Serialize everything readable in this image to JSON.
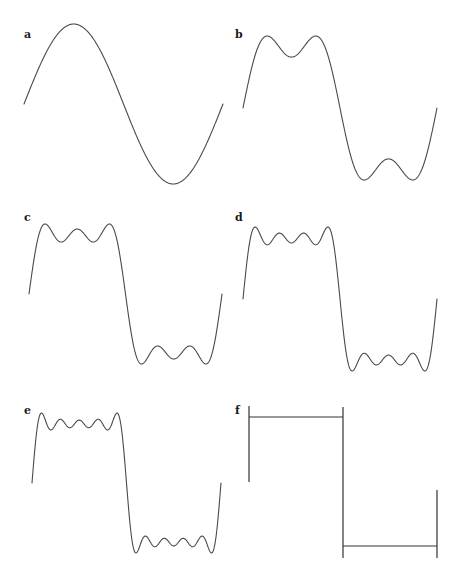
{
  "figure": {
    "panels": [
      {
        "id": "a",
        "label": "a",
        "harmonics": [
          1
        ],
        "x0": 24,
        "x1": 223,
        "ymid": 104,
        "amp": 80,
        "label_x": 24,
        "label_y": 38
      },
      {
        "id": "b",
        "label": "b",
        "harmonics": [
          1,
          3
        ],
        "x0": 243,
        "x1": 437,
        "ymid": 108,
        "amp": 72,
        "label_x": 235,
        "label_y": 38
      },
      {
        "id": "c",
        "label": "c",
        "harmonics": [
          1,
          3,
          5
        ],
        "x0": 29,
        "x1": 222,
        "ymid": 294,
        "amp": 70,
        "label_x": 24,
        "label_y": 221
      },
      {
        "id": "d",
        "label": "d",
        "harmonics": [
          1,
          3,
          5,
          7
        ],
        "x0": 243,
        "x1": 437,
        "ymid": 299,
        "amp": 72,
        "label_x": 235,
        "label_y": 221
      },
      {
        "id": "e",
        "label": "e",
        "harmonics": [
          1,
          3,
          5,
          7,
          9
        ],
        "x0": 32,
        "x1": 221,
        "ymid": 483,
        "amp": 70,
        "label_x": 24,
        "label_y": 414
      },
      {
        "id": "f",
        "label": "f",
        "harmonics": "square",
        "x0": 249,
        "x1": 437,
        "xmid": 343,
        "ytop": 417,
        "ybot": 546,
        "ystart_top": 406,
        "ystart_bot": 482,
        "yend_top": 490,
        "yend_bot": 558,
        "label_x": 235,
        "label_y": 414
      }
    ]
  },
  "colors": {
    "curve": "#4a4a4a",
    "square": "#333333",
    "label": "#1a1a1a",
    "background": "#ffffff"
  }
}
